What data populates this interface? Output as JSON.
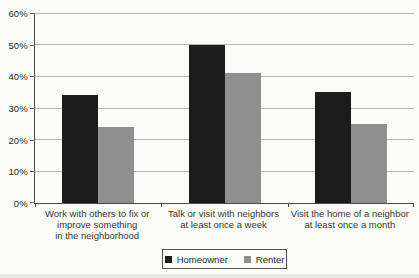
{
  "chart_data": {
    "type": "bar",
    "title": "",
    "categories": [
      "Work with others to fix or\nimprove something\nin the neighborhood",
      "Talk or visit with neighbors\nat least once a week",
      "Visit the home of a neighbor\nat least once a month"
    ],
    "series": [
      {
        "name": "Homeowner",
        "color": "#1c1c1c",
        "values": [
          34,
          50,
          35
        ]
      },
      {
        "name": "Renter",
        "color": "#8f8f8f",
        "values": [
          24,
          41,
          25
        ]
      }
    ],
    "xlabel": "",
    "ylabel": "",
    "ylim": [
      0,
      60
    ],
    "ytick_step": 10,
    "ytick_labels": [
      "0%",
      "10%",
      "20%",
      "30%",
      "40%",
      "50%",
      "60%"
    ],
    "grid": true,
    "legend_position": "bottom-center",
    "bar_width_px": 36,
    "colors": {
      "axis": "#4a4a4a",
      "gridline": "#b6b6b3",
      "text": "#38382f",
      "homeowner": "#1c1c1c",
      "renter": "#8f8f8f"
    }
  }
}
